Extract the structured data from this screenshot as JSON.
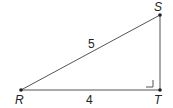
{
  "diagram": {
    "type": "right-triangle",
    "vertices": [
      {
        "name": "R",
        "x": 21,
        "y": 90,
        "label_x": 15,
        "label_y": 104
      },
      {
        "name": "S",
        "x": 160,
        "y": 15,
        "label_x": 154,
        "label_y": 11
      },
      {
        "name": "T",
        "x": 160,
        "y": 90,
        "label_x": 154,
        "label_y": 104
      }
    ],
    "sides": [
      {
        "from": "R",
        "to": "S",
        "length_label": "5",
        "label_x": 88,
        "label_y": 48
      },
      {
        "from": "R",
        "to": "T",
        "length_label": "4",
        "label_x": 86,
        "label_y": 104
      },
      {
        "from": "T",
        "to": "S",
        "length_label": ""
      }
    ],
    "right_angle_at": "T",
    "colors": {
      "line": "#555555",
      "point": "#222222",
      "text": "#222222"
    }
  }
}
